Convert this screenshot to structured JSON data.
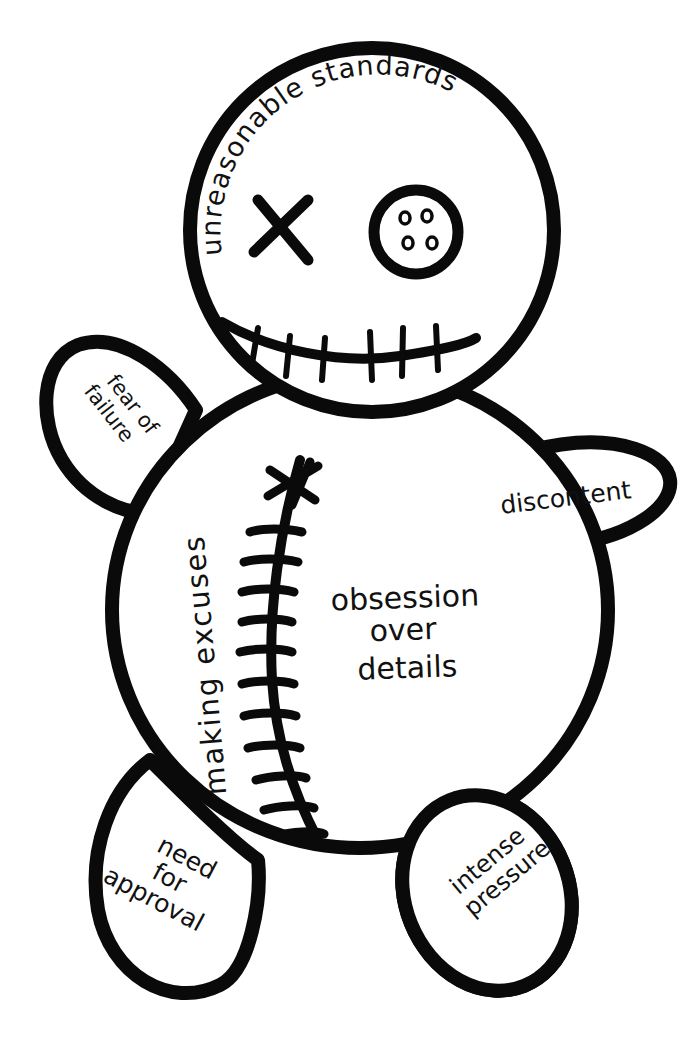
{
  "image": {
    "subject": "voodoo doll",
    "background_color": "#ffffff",
    "ink_color": "#0a0a0a"
  },
  "labels": {
    "head": "unreasonable standards",
    "left_arm_line1": "fear of",
    "left_arm_line2": "failure",
    "right_arm": "discontent",
    "body_side": "making excuses",
    "body_center_line1": "obsession",
    "body_center_line2": "over",
    "body_center_line3": "details",
    "left_leg_line1": "need",
    "left_leg_line2": "for",
    "left_leg_line3": "approval",
    "right_leg_line1": "intense",
    "right_leg_line2": "pressure"
  },
  "face": {
    "left_eye": "x-eye-icon",
    "right_eye": "button-eye-icon",
    "mouth": "stitched-mouth-icon",
    "mouth_stitch_count": 6
  },
  "body": {
    "seam": "stitched-seam-icon",
    "seam_stitch_count": 11
  }
}
